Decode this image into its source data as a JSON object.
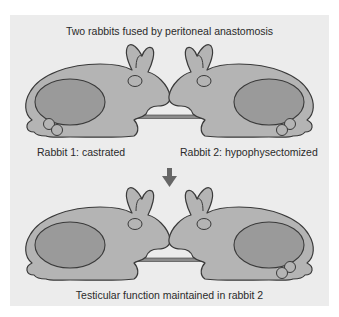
{
  "title": "Two rabbits fused by peritoneal anastomosis",
  "top_row": {
    "rabbit1_label": "Rabbit 1: castrated",
    "rabbit2_label": "Rabbit 2: hypophysectomized"
  },
  "arrow": "down-arrow-icon",
  "caption": "Testicular function maintained in rabbit 2",
  "colors": {
    "panel": "#ececec",
    "body": "#b4b4b4",
    "organ": "#9a9a9a",
    "outline": "#3a3a3a",
    "connector": "#8c8c8c",
    "arrow": "#666666"
  }
}
